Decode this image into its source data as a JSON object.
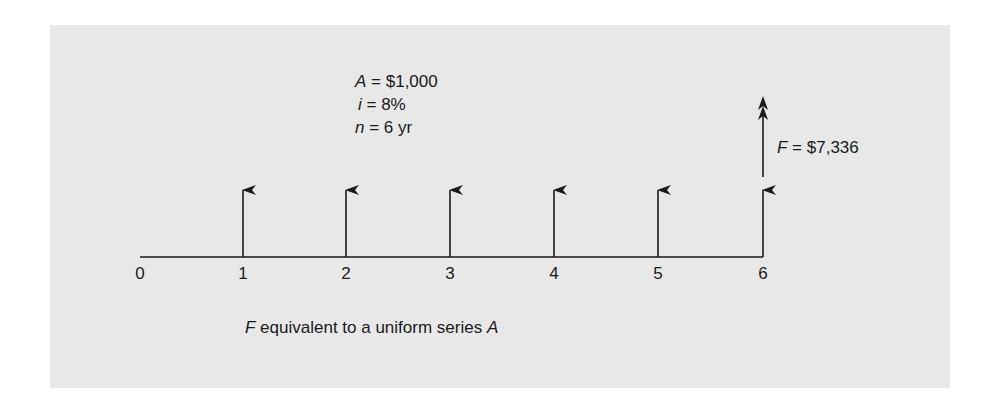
{
  "figure": {
    "caption_var": "F",
    "caption_text": " equivalent to a uniform series ",
    "caption_var2": "A"
  },
  "parameters": [
    {
      "var": "A",
      "eq": " = ",
      "value": "$1,000"
    },
    {
      "var": "i",
      "eq": " = ",
      "value": "8%"
    },
    {
      "var": "n",
      "eq": " = ",
      "value": "6 yr"
    }
  ],
  "future_value": {
    "var": "F",
    "eq": " = ",
    "value": "$7,336"
  },
  "timeline": {
    "ticks": [
      "0",
      "1",
      "2",
      "3",
      "4",
      "5",
      "6"
    ]
  },
  "colors": {
    "panel": "#e8e8e8",
    "ink": "#1a1a1a"
  }
}
